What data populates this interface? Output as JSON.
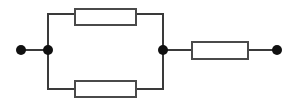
{
  "diagram": {
    "type": "electrical-circuit-schematic",
    "canvas": {
      "width": 297,
      "height": 107,
      "background": "#ffffff"
    },
    "style": {
      "wire_color": "#3a3a3a",
      "wire_width": 2,
      "component_stroke": "#4a4a4a",
      "component_fill": "#ffffff",
      "component_stroke_width": 2,
      "node_color": "#111111",
      "terminal_color": "#111111",
      "node_radius": 5,
      "terminal_radius": 5
    },
    "terminals": [
      {
        "id": "terminal-left",
        "label": "",
        "x": 21,
        "y": 50
      },
      {
        "id": "terminal-right",
        "label": "",
        "x": 277,
        "y": 50
      }
    ],
    "nodes": [
      {
        "id": "node-left-junction",
        "label": "",
        "x": 48,
        "y": 50
      },
      {
        "id": "node-right-junction",
        "label": "",
        "x": 163,
        "y": 50
      }
    ],
    "components": [
      {
        "id": "resistor-top",
        "kind": "resistor",
        "label": "",
        "orientation": "horizontal",
        "x": 75,
        "y": 9,
        "width": 61,
        "height": 16,
        "branch": "parallel-upper"
      },
      {
        "id": "resistor-bottom",
        "kind": "resistor",
        "label": "",
        "orientation": "horizontal",
        "x": 75,
        "y": 81,
        "width": 61,
        "height": 16,
        "branch": "parallel-lower"
      },
      {
        "id": "resistor-series",
        "kind": "resistor",
        "label": "",
        "orientation": "horizontal",
        "x": 192,
        "y": 42,
        "width": 56,
        "height": 17,
        "branch": "series-right"
      }
    ],
    "wires": [
      {
        "id": "wire-left-lead",
        "points": "21,50 48,50"
      },
      {
        "id": "wire-left-rail",
        "points": "48,14 48,89"
      },
      {
        "id": "wire-top-left-stub",
        "points": "48,14 75,14"
      },
      {
        "id": "wire-top-right-stub",
        "points": "136,14 163,14"
      },
      {
        "id": "wire-bottom-left-stub",
        "points": "48,89 75,89"
      },
      {
        "id": "wire-bottom-right-stub",
        "points": "136,89 163,89"
      },
      {
        "id": "wire-right-rail",
        "points": "163,14 163,89"
      },
      {
        "id": "wire-series-left-stub",
        "points": "163,50 192,50"
      },
      {
        "id": "wire-series-right-stub",
        "points": "248,50 277,50"
      }
    ]
  }
}
